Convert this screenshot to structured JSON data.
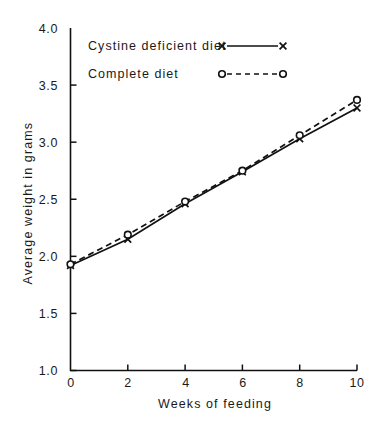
{
  "chart_data": {
    "type": "line",
    "title": "",
    "xlabel": "Weeks of feeding",
    "ylabel": "Average weight in grams",
    "x": [
      0,
      2,
      4,
      6,
      8,
      10
    ],
    "xlim": [
      0,
      10
    ],
    "ylim": [
      1.0,
      4.0
    ],
    "xticks": [
      "0",
      "2",
      "4",
      "6",
      "8",
      "10"
    ],
    "yticks": [
      "1.0",
      "1.5",
      "2.0",
      "2.5",
      "3.0",
      "3.5",
      "4.0"
    ],
    "grid": false,
    "legend_position": "upper-left-inside",
    "series": [
      {
        "name": "Cystine deficient diet",
        "marker": "x",
        "linestyle": "solid",
        "color": "#111111",
        "values": [
          1.92,
          2.15,
          2.46,
          2.74,
          3.03,
          3.3
        ]
      },
      {
        "name": "Complete diet",
        "marker": "o",
        "linestyle": "dashed",
        "color": "#111111",
        "values": [
          1.93,
          2.19,
          2.48,
          2.75,
          3.06,
          3.37
        ]
      }
    ]
  },
  "legend": {
    "entries": [
      {
        "label": "Cystine deficient diet",
        "marker_left": "x",
        "marker_right": "x"
      },
      {
        "label": "Complete diet",
        "marker_left": "o",
        "marker_right": "o"
      }
    ]
  },
  "axes": {
    "y_title": "Average weight in grams",
    "x_title": "Weeks of feeding",
    "y_tick_labels": [
      "4.0",
      "3.5",
      "3.0",
      "2.5",
      "2.0",
      "1.5",
      "1.0"
    ],
    "x_tick_labels": [
      "0",
      "2",
      "4",
      "6",
      "8",
      "10"
    ]
  },
  "colors": {
    "ink": "#111111",
    "background": "#ffffff"
  }
}
